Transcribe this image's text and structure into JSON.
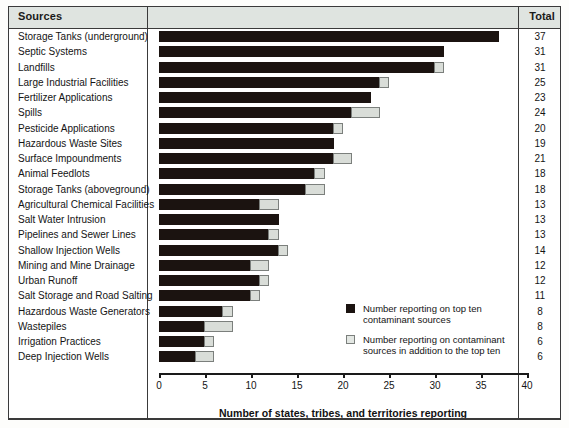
{
  "header": {
    "sources_label": "Sources",
    "total_label": "Total"
  },
  "chart_data": {
    "type": "bar",
    "orientation": "horizontal",
    "stacked": true,
    "title": "",
    "xlabel": "Number of states, tribes, and territories reporting",
    "ylabel": "",
    "xlim": [
      0,
      40
    ],
    "xticks": [
      0,
      5,
      10,
      15,
      20,
      25,
      30,
      35,
      40
    ],
    "grid": false,
    "legend_position": "inside-right",
    "colors": {
      "top_ten": "#1b1310",
      "additional": "#d9ddd8"
    },
    "legend": [
      "Number reporting on top ten contaminant sources",
      "Number reporting on contaminant sources in addition to the top ten"
    ],
    "categories": [
      "Storage Tanks (underground)",
      "Septic Systems",
      "Landfills",
      "Large Industrial Facilities",
      "Fertilizer Applications",
      "Spills",
      "Pesticide Applications",
      "Hazardous Waste Sites",
      "Surface Impoundments",
      "Animal Feedlots",
      "Storage Tanks (aboveground)",
      "Agricultural Chemical Facilities",
      "Salt Water Intrusion",
      "Pipelines and Sewer Lines",
      "Shallow Injection Wells",
      "Mining and Mine Drainage",
      "Urban Runoff",
      "Salt Storage and Road Salting",
      "Hazardous Waste Generators",
      "Wastepiles",
      "Irrigation Practices",
      "Deep Injection Wells"
    ],
    "series": [
      {
        "name": "Number reporting on top ten contaminant sources",
        "values": [
          37,
          31,
          30,
          24,
          23,
          21,
          19,
          19,
          19,
          17,
          16,
          11,
          13,
          12,
          13,
          10,
          11,
          10,
          7,
          5,
          5,
          4
        ]
      },
      {
        "name": "Number reporting on contaminant sources in addition to the top ten",
        "values": [
          0,
          0,
          1,
          1,
          0,
          3,
          1,
          0,
          2,
          1,
          2,
          2,
          0,
          1,
          1,
          2,
          1,
          1,
          1,
          3,
          1,
          2
        ]
      }
    ],
    "totals": [
      37,
      31,
      31,
      25,
      23,
      24,
      20,
      19,
      21,
      18,
      18,
      13,
      13,
      13,
      14,
      12,
      12,
      11,
      8,
      8,
      6,
      6
    ]
  }
}
